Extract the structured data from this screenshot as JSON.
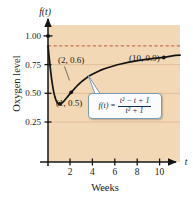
{
  "chart_data": {
    "type": "line",
    "title": "",
    "xlabel": "Weeks",
    "ylabel": "Oxygen level",
    "x_axis_variable": "t",
    "y_axis_variable": "f(t)",
    "xlim": [
      0,
      11.4
    ],
    "ylim": [
      0,
      1.18
    ],
    "grid": true,
    "legend": "none",
    "x_ticks": [
      2,
      4,
      6,
      8,
      10
    ],
    "x_tick_labels": [
      "2",
      "4",
      "6",
      "8",
      "10"
    ],
    "y_ticks": [
      0.25,
      0.5,
      0.75,
      1.0
    ],
    "y_tick_labels": [
      "0.25",
      "0.50",
      "0.75",
      "1.00"
    ],
    "equation_text": "f(t) = (t^2 - t + 1) / (t^2 + 1)",
    "equation_lhs": "f(t) =",
    "equation_numerator": "t² − t + 1",
    "equation_denominator": "t² + 1",
    "reference_line": {
      "value": 1.0,
      "style": "dashed",
      "color": "#b5462a",
      "orientation": "horizontal"
    },
    "series": [
      {
        "name": "oxygen level",
        "values": [
          [
            0,
            1.0
          ],
          [
            0.1,
            0.901
          ],
          [
            0.2,
            0.808
          ],
          [
            0.3,
            0.725
          ],
          [
            0.4,
            0.655
          ],
          [
            0.5,
            0.6
          ],
          [
            0.6,
            0.559
          ],
          [
            0.7,
            0.53
          ],
          [
            0.8,
            0.512
          ],
          [
            0.9,
            0.503
          ],
          [
            1.0,
            0.5
          ],
          [
            1.1,
            0.502
          ],
          [
            1.2,
            0.508
          ],
          [
            1.4,
            0.527
          ],
          [
            1.6,
            0.551
          ],
          [
            1.8,
            0.576
          ],
          [
            2.0,
            0.6
          ],
          [
            2.5,
            0.655
          ],
          [
            3.0,
            0.7
          ],
          [
            3.5,
            0.738
          ],
          [
            4.0,
            0.765
          ],
          [
            4.5,
            0.789
          ],
          [
            5.0,
            0.808
          ],
          [
            6.0,
            0.838
          ],
          [
            7.0,
            0.86
          ],
          [
            8.0,
            0.877
          ],
          [
            9.0,
            0.89
          ],
          [
            10.0,
            0.901
          ],
          [
            11.0,
            0.918
          ],
          [
            11.4,
            0.92
          ]
        ]
      }
    ],
    "annotated_points": [
      {
        "label": "(1, 0.5)",
        "x": 1,
        "y": 0.5,
        "label_position": "below-right"
      },
      {
        "label": "(2, 0.6)",
        "x": 2,
        "y": 0.6,
        "label_position": "above-left"
      },
      {
        "label": "(10, 0.9)",
        "x": 10,
        "y": 0.9,
        "label_position": "below-left"
      }
    ],
    "colors": {
      "plot_background": "#f3d8b6",
      "curve": "#141414",
      "axis": "#141414",
      "gridline": "#d9b58e",
      "dashed_reference": "#b5462a",
      "callout_border": "#7a9ab5",
      "callout_background": "#fbfcfd",
      "callout_text": "#12304d",
      "text": "#1a1a1a"
    }
  }
}
